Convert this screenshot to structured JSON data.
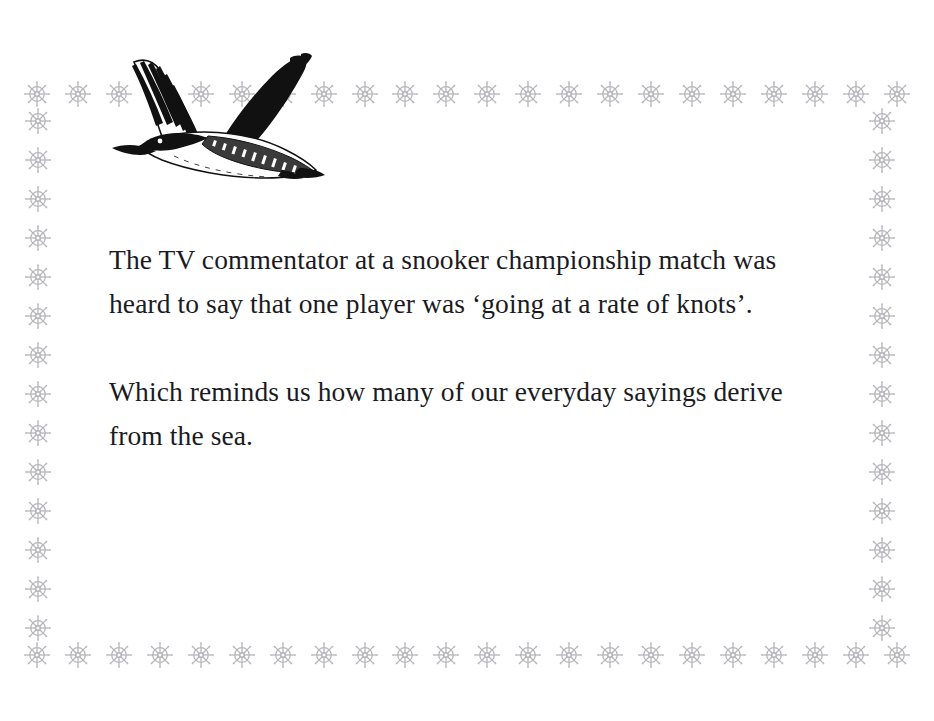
{
  "page": {
    "background_color": "#ffffff",
    "width": 934,
    "height": 721
  },
  "border": {
    "ornament_icon": "ships-wheel-icon",
    "ornament_color": "#b3b3b8",
    "top_row_count": 22,
    "bottom_row_count": 22,
    "left_column_count": 14,
    "right_column_count": 14
  },
  "illustration": {
    "icon": "flying-seabird-icon",
    "description": "Flying loon seabird line illustration",
    "ink_color": "#000000"
  },
  "content": {
    "paragraphs": [
      "The TV commentator at a snooker championship match was heard to say that one player was ‘going at a rate of knots’.",
      "Which reminds us how many of our everyday sayings derive from the sea."
    ],
    "text_color": "#1b1b1f"
  }
}
